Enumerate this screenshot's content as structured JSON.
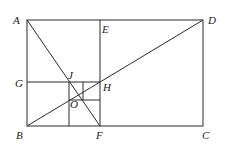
{
  "diagram": {
    "type": "geometry",
    "points": {
      "A": {
        "label": "A",
        "x": 27,
        "y": 20
      },
      "B": {
        "label": "B",
        "x": 27,
        "y": 126
      },
      "C": {
        "label": "C",
        "x": 203,
        "y": 126
      },
      "D": {
        "label": "D",
        "x": 203,
        "y": 20
      },
      "E": {
        "label": "E",
        "x": 100,
        "y": 20
      },
      "F": {
        "label": "F",
        "x": 100,
        "y": 126
      },
      "G": {
        "label": "G",
        "x": 27,
        "y": 82
      },
      "H": {
        "label": "H",
        "x": 100,
        "y": 82
      },
      "J": {
        "label": "J",
        "x": 69,
        "y": 82
      },
      "O": {
        "label": "O",
        "x": 79,
        "y": 98
      }
    },
    "segments": [
      [
        "A",
        "D"
      ],
      [
        "D",
        "C"
      ],
      [
        "C",
        "B"
      ],
      [
        "B",
        "A"
      ],
      [
        "E",
        "F"
      ],
      [
        "G",
        "H"
      ],
      [
        "B",
        "D"
      ],
      [
        "A",
        "F"
      ]
    ],
    "labels": {
      "A": "A",
      "B": "B",
      "C": "C",
      "D": "D",
      "E": "E",
      "F": "F",
      "G": "G",
      "H": "H",
      "J": "J",
      "O": "O"
    }
  }
}
